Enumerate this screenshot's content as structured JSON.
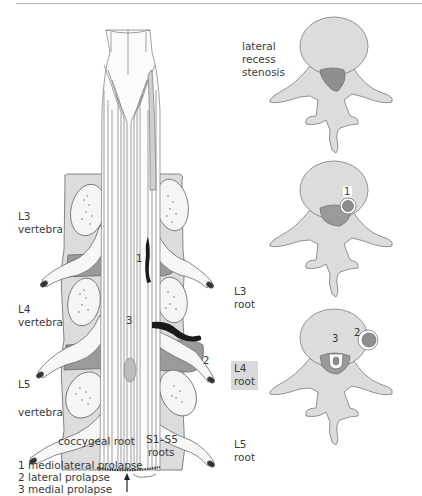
{
  "figure": {
    "colors": {
      "bone_light": "#dcdcdc",
      "bone_mid": "#c8c8c8",
      "disc_dark": "#8e8e8e",
      "canal_dark": "#9a9a9a",
      "prolapse_black": "#1a1a1a",
      "outline": "#6a6a6a"
    },
    "left_panel": {
      "vertebra_labels": [
        {
          "line1": "L3",
          "line2": "vertebra"
        },
        {
          "line1": "L4",
          "line2": "vertebra"
        },
        {
          "line1": "L5",
          "line2": "vertebra"
        }
      ],
      "markers": {
        "m1": "1",
        "m2": "2",
        "m3": "3"
      },
      "coccygeal_label": "coccygeal root",
      "sacral_label_line1": "S1–S5",
      "sacral_label_line2": "roots"
    },
    "right_panel": {
      "stenosis_label": [
        "lateral",
        "recess",
        "stenosis"
      ],
      "root_labels": [
        {
          "line1": "L3",
          "line2": "root",
          "highlighted": false
        },
        {
          "line1": "L4",
          "line2": "root",
          "highlighted": true
        },
        {
          "line1": "L5",
          "line2": "root",
          "highlighted": false
        }
      ],
      "cross_section_markers": {
        "top": "",
        "middle": "1",
        "bottom_a": "3",
        "bottom_b": "2"
      }
    },
    "legend": [
      "1 mediolateral prolapse",
      "2 lateral prolapse",
      "3 medial prolapse"
    ]
  }
}
